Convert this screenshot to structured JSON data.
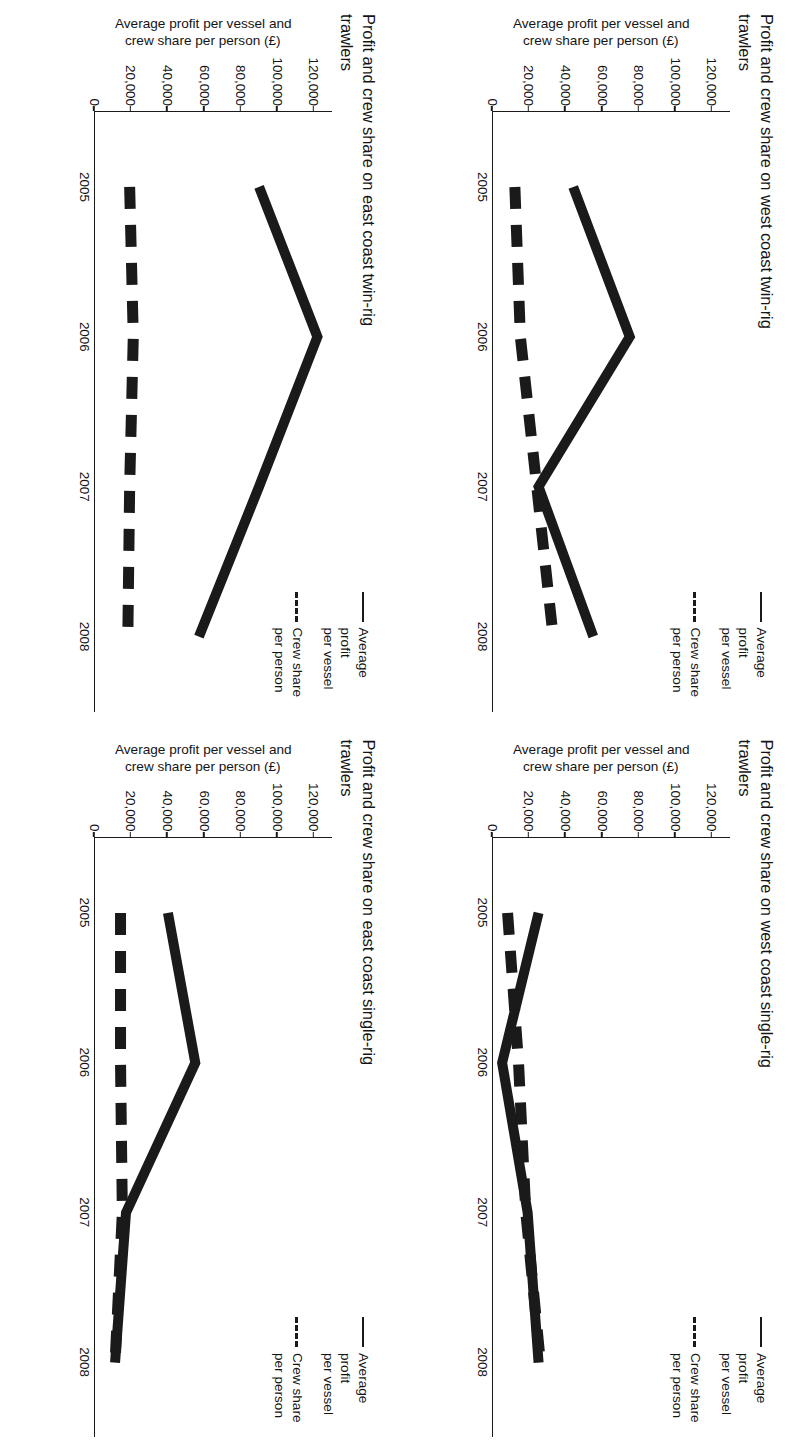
{
  "page": {
    "background": "#ffffff",
    "ink_color": "#1a1a1a",
    "orientation_note": "landscape sheet rotated 90° clockwise"
  },
  "legend": {
    "series": [
      {
        "label": "Average profit\nper vessel",
        "style": "solid",
        "color": "#1a1a1a"
      },
      {
        "label": "Crew share\nper person",
        "style": "dashed",
        "color": "#1a1a1a"
      }
    ]
  },
  "axis": {
    "ylabel": "Average profit per vessel and\ncrew share per person (£)",
    "yticks": [
      "0",
      "20,000",
      "40,000",
      "60,000",
      "80,000",
      "100,000",
      "120,000"
    ],
    "ytick_values": [
      0,
      20000,
      40000,
      60000,
      80000,
      100000,
      120000
    ],
    "xticks": [
      "2005",
      "2006",
      "2007",
      "2008"
    ],
    "ylim": [
      0,
      130000
    ],
    "currency": "£"
  },
  "chart_data": [
    {
      "id": "west-coast-twin-rig",
      "type": "line",
      "title": "Profit and crew share on west coast\ntwin-rig trawlers",
      "xlabel": "",
      "ylabel": "Average profit per vessel and\ncrew share per person (£)",
      "categories": [
        "2005",
        "2006",
        "2007",
        "2008"
      ],
      "ylim": [
        0,
        130000
      ],
      "grid": false,
      "legend_position": "top-right",
      "series": [
        {
          "name": "Average profit per vessel",
          "style": "solid",
          "values": [
            44000,
            75000,
            25000,
            55000
          ]
        },
        {
          "name": "Crew share per person",
          "style": "dashed",
          "values": [
            12000,
            15000,
            24000,
            33000
          ]
        }
      ]
    },
    {
      "id": "west-coast-single-rig",
      "type": "line",
      "title": "Profit and crew share on west coast\nsingle-rig trawlers",
      "xlabel": "",
      "ylabel": "Average profit per vessel and\ncrew share per person (£)",
      "categories": [
        "2005",
        "2006",
        "2007",
        "2008"
      ],
      "ylim": [
        0,
        130000
      ],
      "grid": false,
      "legend_position": "top-right",
      "series": [
        {
          "name": "Average profit per vessel",
          "style": "solid",
          "values": [
            25000,
            5000,
            19000,
            25000
          ]
        },
        {
          "name": "Crew share per person",
          "style": "dashed",
          "values": [
            8000,
            14000,
            18000,
            26000
          ]
        }
      ]
    },
    {
      "id": "east-coast-twin-rig",
      "type": "line",
      "title": "Profit and crew share on east coast\ntwin-rig trawlers",
      "xlabel": "",
      "ylabel": "Average profit per vessel and\ncrew share per person (£)",
      "categories": [
        "2005",
        "2006",
        "2007",
        "2008"
      ],
      "ylim": [
        0,
        130000
      ],
      "grid": false,
      "legend_position": "top-right",
      "series": [
        {
          "name": "Average profit per vessel",
          "style": "solid",
          "values": [
            90000,
            122000,
            90000,
            57000
          ]
        },
        {
          "name": "Crew share per person",
          "style": "dashed",
          "values": [
            19000,
            21000,
            19000,
            18000
          ]
        }
      ]
    },
    {
      "id": "east-coast-single-rig",
      "type": "line",
      "title": "Profit and crew share on east coast\nsingle-rig trawlers",
      "xlabel": "",
      "ylabel": "Average profit per vessel and\ncrew share per person (£)",
      "categories": [
        "2005",
        "2006",
        "2007",
        "2008"
      ],
      "ylim": [
        0,
        130000
      ],
      "grid": false,
      "legend_position": "top-right",
      "series": [
        {
          "name": "Average profit per vessel",
          "style": "solid",
          "values": [
            40000,
            55000,
            17000,
            11000
          ]
        },
        {
          "name": "Crew share per person",
          "style": "dashed",
          "values": [
            14000,
            14000,
            15000,
            11000
          ]
        }
      ]
    }
  ]
}
